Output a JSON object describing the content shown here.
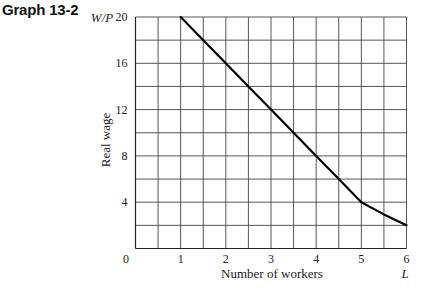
{
  "figure": {
    "title": "Graph 13-2"
  },
  "chart_data": {
    "type": "line",
    "title": "Graph 13-2",
    "xlabel": "Number of workers",
    "xlabel_symbol": "L",
    "ylabel": "Real wage",
    "ylabel_symbol": "W/P",
    "xlim": [
      0,
      6
    ],
    "ylim": [
      0,
      20
    ],
    "x_ticks": [
      0,
      1,
      2,
      3,
      4,
      5,
      6
    ],
    "y_ticks": [
      4,
      8,
      12,
      16,
      20
    ],
    "origin_label": "0",
    "grid": true,
    "grid_x_step": 0.5,
    "grid_y_step": 2,
    "legend": null,
    "series": [
      {
        "name": "Real wage vs. number of workers",
        "x": [
          1,
          1.5,
          2,
          2.5,
          3,
          3.5,
          4,
          4.5,
          5,
          5.5,
          6
        ],
        "y": [
          20,
          18,
          16,
          14,
          12,
          10,
          8,
          6,
          4,
          2.95,
          2
        ],
        "color": "#000000"
      }
    ]
  }
}
